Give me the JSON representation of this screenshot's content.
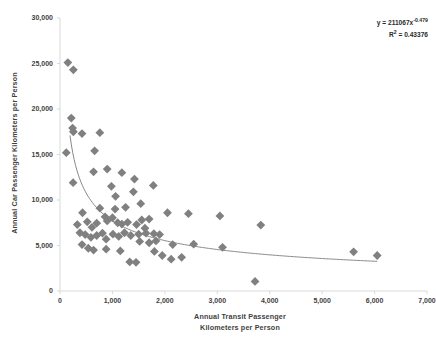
{
  "chart_data": {
    "type": "scatter",
    "title": "",
    "xlabel": "Annual Transit Passenger Kilometers per Person",
    "xlabel_lines": [
      "Annual Transit Passenger",
      "Kilometers per Person"
    ],
    "ylabel": "Annual Car Passenger Kilometers per Person",
    "xlim": [
      0,
      7000
    ],
    "ylim": [
      0,
      30000
    ],
    "xticks": [
      0,
      1000,
      2000,
      3000,
      4000,
      5000,
      6000,
      7000
    ],
    "xtick_labels": [
      "0",
      "1,000",
      "2,000",
      "3,000",
      "4,000",
      "5,000",
      "6,000",
      "7,000"
    ],
    "yticks": [
      0,
      5000,
      10000,
      15000,
      20000,
      25000,
      30000
    ],
    "ytick_labels": [
      "0",
      "5,000",
      "10,000",
      "15,000",
      "20,000",
      "25,000",
      "30,000"
    ],
    "grid": false,
    "legend": false,
    "marker_shape": "diamond",
    "marker_color": "#808080",
    "marker_size": 4.4,
    "axis_color": "#d9d9d9",
    "text_color": "#3f3f3f",
    "background": "#ffffff",
    "annotations": {
      "equation": "y = 211067x",
      "equation_exponent": "-0.479",
      "r_squared_label": "R",
      "r_squared_sup": "2",
      "r_squared_value": " = 0.43376",
      "equation_full": "y = 211067x^-0.479",
      "r_squared_full": "R² = 0.43376"
    },
    "trendline": {
      "type": "power",
      "color": "#7a7a7a",
      "width": 0.9,
      "coefficient": 211067,
      "exponent": -0.479,
      "r_squared": 0.43376,
      "x_start": 190,
      "x_end": 6050
    },
    "points": [
      {
        "x": 150,
        "y": 25100
      },
      {
        "x": 255,
        "y": 24300
      },
      {
        "x": 120,
        "y": 15200
      },
      {
        "x": 215,
        "y": 19000
      },
      {
        "x": 240,
        "y": 17900
      },
      {
        "x": 255,
        "y": 17500
      },
      {
        "x": 420,
        "y": 17300
      },
      {
        "x": 760,
        "y": 17400
      },
      {
        "x": 660,
        "y": 15400
      },
      {
        "x": 640,
        "y": 13100
      },
      {
        "x": 900,
        "y": 13400
      },
      {
        "x": 250,
        "y": 11900
      },
      {
        "x": 1180,
        "y": 13000
      },
      {
        "x": 1420,
        "y": 12300
      },
      {
        "x": 980,
        "y": 11500
      },
      {
        "x": 1060,
        "y": 10400
      },
      {
        "x": 1400,
        "y": 10900
      },
      {
        "x": 1780,
        "y": 11600
      },
      {
        "x": 1050,
        "y": 9000
      },
      {
        "x": 1250,
        "y": 9200
      },
      {
        "x": 430,
        "y": 8600
      },
      {
        "x": 520,
        "y": 7600
      },
      {
        "x": 330,
        "y": 7300
      },
      {
        "x": 610,
        "y": 7000
      },
      {
        "x": 700,
        "y": 7450
      },
      {
        "x": 860,
        "y": 8150
      },
      {
        "x": 900,
        "y": 7700
      },
      {
        "x": 1000,
        "y": 8050
      },
      {
        "x": 1100,
        "y": 7500
      },
      {
        "x": 1180,
        "y": 7350
      },
      {
        "x": 1290,
        "y": 7550
      },
      {
        "x": 1460,
        "y": 7300
      },
      {
        "x": 1560,
        "y": 7800
      },
      {
        "x": 1700,
        "y": 7900
      },
      {
        "x": 1620,
        "y": 6900
      },
      {
        "x": 2050,
        "y": 8600
      },
      {
        "x": 2450,
        "y": 8500
      },
      {
        "x": 3050,
        "y": 8250
      },
      {
        "x": 3830,
        "y": 7250
      },
      {
        "x": 380,
        "y": 6400
      },
      {
        "x": 480,
        "y": 6200
      },
      {
        "x": 590,
        "y": 5900
      },
      {
        "x": 700,
        "y": 6100
      },
      {
        "x": 810,
        "y": 6350
      },
      {
        "x": 880,
        "y": 5700
      },
      {
        "x": 1010,
        "y": 6250
      },
      {
        "x": 1120,
        "y": 6000
      },
      {
        "x": 1230,
        "y": 6400
      },
      {
        "x": 1350,
        "y": 6100
      },
      {
        "x": 1500,
        "y": 6250
      },
      {
        "x": 1640,
        "y": 6350
      },
      {
        "x": 1790,
        "y": 6300
      },
      {
        "x": 1900,
        "y": 6200
      },
      {
        "x": 1520,
        "y": 5450
      },
      {
        "x": 1700,
        "y": 5300
      },
      {
        "x": 1830,
        "y": 5500
      },
      {
        "x": 2150,
        "y": 5100
      },
      {
        "x": 2550,
        "y": 5150
      },
      {
        "x": 3100,
        "y": 4800
      },
      {
        "x": 5600,
        "y": 4300
      },
      {
        "x": 6050,
        "y": 3900
      },
      {
        "x": 420,
        "y": 5100
      },
      {
        "x": 540,
        "y": 4700
      },
      {
        "x": 640,
        "y": 4500
      },
      {
        "x": 880,
        "y": 4600
      },
      {
        "x": 1150,
        "y": 4400
      },
      {
        "x": 1330,
        "y": 3200
      },
      {
        "x": 1450,
        "y": 3150
      },
      {
        "x": 1800,
        "y": 4350
      },
      {
        "x": 1950,
        "y": 3900
      },
      {
        "x": 2120,
        "y": 3500
      },
      {
        "x": 2320,
        "y": 3700
      },
      {
        "x": 3720,
        "y": 1050
      },
      {
        "x": 760,
        "y": 9100
      },
      {
        "x": 1540,
        "y": 9600
      }
    ]
  }
}
